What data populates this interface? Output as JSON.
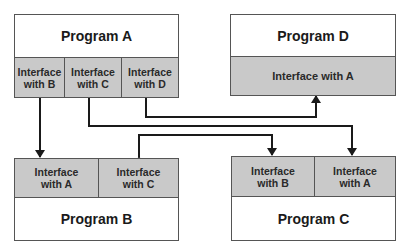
{
  "diagram": {
    "programs": {
      "a": {
        "title": "Program A",
        "interfaces": [
          "Interface\nwith B",
          "Interface\nwith C",
          "Interface\nwith D"
        ]
      },
      "b": {
        "title": "Program B",
        "interfaces": [
          "Interface\nwith A",
          "Interface\nwith C"
        ]
      },
      "c": {
        "title": "Program C",
        "interfaces": [
          "Interface\nwith B",
          "Interface\nwith A"
        ]
      },
      "d": {
        "title": "Program D",
        "interfaces": [
          "Interface with A"
        ]
      }
    },
    "connections": [
      {
        "from": "Program A / Interface with B",
        "to": "Program B / Interface with A",
        "type": "bidirectional"
      },
      {
        "from": "Program A / Interface with C",
        "to": "Program C / Interface with A",
        "type": "bidirectional"
      },
      {
        "from": "Program A / Interface with D",
        "to": "Program D / Interface with A",
        "type": "bidirectional"
      },
      {
        "from": "Program B / Interface with C",
        "to": "Program C / Interface with B",
        "type": "bidirectional"
      }
    ],
    "colors": {
      "interface_fill": "#c9c9c9",
      "program_fill": "#ffffff",
      "border": "#555555",
      "arrow": "#1a1a1a"
    }
  }
}
